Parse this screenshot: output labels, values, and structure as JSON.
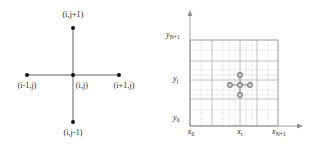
{
  "figure": {
    "type": "diagram",
    "background_color": "#ffffff",
    "ink_color": "#1a1a1a",
    "grid_color": "#b9b9b9",
    "stencil_gray": "#9a9a9a",
    "width": 320,
    "height": 153
  },
  "panels": [
    {
      "id": "stencil",
      "name": "five-point-stencil",
      "nodes": [
        {
          "id": "north",
          "label_plain": "(i,j+1)",
          "label_base": "(i,j+1)",
          "x": 73,
          "y": 28,
          "label_x": 73,
          "label_y": 13
        },
        {
          "id": "west",
          "label_plain": "(i-1,j)",
          "label_base": "(i-1,j)",
          "x": 27,
          "y": 75,
          "label_x": 27,
          "label_y": 84
        },
        {
          "id": "center",
          "label_plain": "(i,j)",
          "label_base": "(i,j)",
          "x": 73,
          "y": 75,
          "label_x": 80,
          "label_y": 84
        },
        {
          "id": "east",
          "label_plain": "(i+1,j)",
          "label_base": "(i+1,j)",
          "x": 119,
          "y": 75,
          "label_x": 122,
          "label_y": 84
        },
        {
          "id": "south",
          "label_plain": "(i,j-1)",
          "label_base": "(i,j-1)",
          "x": 73,
          "y": 122,
          "label_x": 73,
          "label_y": 130
        }
      ],
      "edges": [
        {
          "from": "west",
          "to": "east"
        },
        {
          "from": "north",
          "to": "south"
        }
      ],
      "dot_radius": 2.0
    },
    {
      "id": "grid",
      "name": "computational-grid-domain",
      "axis": {
        "x_axis_label_left": "x_0",
        "y_axis_label_bottom": "y_0",
        "origin_x": 30,
        "origin_y": 126,
        "x_arrow_end": 141,
        "y_arrow_end": 12
      },
      "axis_labels": [
        {
          "id": "y-top",
          "base": "y",
          "sub": "N+1",
          "x": 8,
          "y": 36,
          "align": "left"
        },
        {
          "id": "y-mid",
          "base": "y",
          "sub": "j",
          "x": 14,
          "y": 80,
          "align": "left"
        },
        {
          "id": "y-bottom",
          "base": "y",
          "sub": "0",
          "x": 14,
          "y": 119,
          "align": "left"
        },
        {
          "id": "x-left",
          "base": "x",
          "sub": "0",
          "x": 30,
          "y": 131,
          "align": "center"
        },
        {
          "id": "x-mid",
          "base": "x",
          "sub": "i",
          "x": 80,
          "y": 131,
          "align": "center"
        },
        {
          "id": "x-right",
          "base": "x",
          "sub": "N+1",
          "x": 119,
          "y": 131,
          "align": "center"
        }
      ],
      "domain_box": {
        "left": 30,
        "right": 118,
        "top": 40,
        "bottom": 126
      },
      "gridlines": {
        "vertical_x": [
          41,
          52,
          63,
          69,
          75,
          80,
          86,
          92,
          97,
          108
        ],
        "horizontal_y": [
          50,
          61,
          70,
          75,
          80,
          85,
          90,
          99,
          110
        ],
        "solid_vertical_x": [
          52,
          80,
          97
        ],
        "solid_horizontal_y": [
          61,
          80,
          99
        ]
      },
      "stencil_overlay": {
        "center": {
          "x": 80,
          "y": 85
        },
        "offset": 10,
        "dot_radius": 2.6,
        "nodes": [
          {
            "id": "center",
            "x": 80,
            "y": 85
          },
          {
            "id": "north",
            "x": 80,
            "y": 75
          },
          {
            "id": "south",
            "x": 80,
            "y": 95
          },
          {
            "id": "west",
            "x": 70,
            "y": 85
          },
          {
            "id": "east",
            "x": 90,
            "y": 85
          }
        ]
      }
    }
  ]
}
